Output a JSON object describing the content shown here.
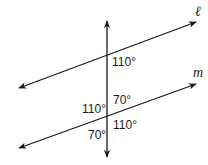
{
  "diagram": {
    "type": "transversal-crossing-two-lines",
    "line_color": "#1a1a1a",
    "lines": {
      "transversal": {
        "label": "",
        "x1": 107,
        "y1": 21,
        "x2": 107,
        "y2": 157,
        "arrows": "both"
      },
      "l": {
        "label": "ℓ",
        "x1": 19,
        "y1": 88,
        "x2": 196,
        "y2": 22,
        "arrows": "both"
      },
      "m": {
        "label": "m",
        "x1": 19,
        "y1": 148,
        "x2": 196,
        "y2": 84,
        "arrows": "both"
      }
    },
    "angles": {
      "l_below_right": "110°",
      "m_above_right": "70°",
      "m_above_left": "110°",
      "m_below_right": "110°",
      "m_below_left": "70°"
    },
    "line_labels": {
      "l": "ℓ",
      "m": "m"
    }
  }
}
